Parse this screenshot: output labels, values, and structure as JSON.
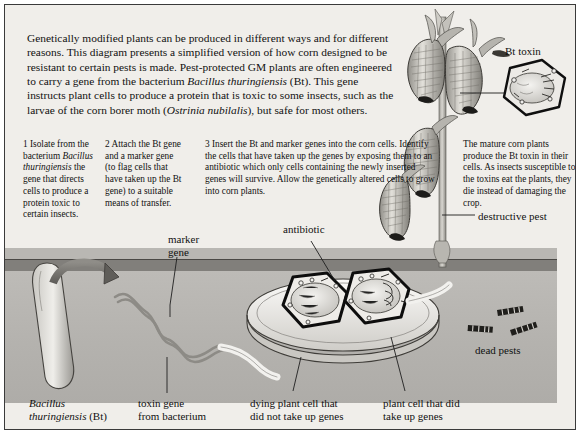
{
  "figure": {
    "intro": "Genetically modified plants can be produced in different ways and for different reasons. This diagram presents a simplified version of how corn designed to be resistant to certain pests is made. Pest-protected GM plants are often engineered to carry a gene from the bacterium ",
    "intro_italic_1": "Bacillus thuringiensis",
    "intro_mid": " (Bt). This gene instructs plant cells to produce a protein that is toxic to some insects, such as the larvae of the corn borer moth (",
    "intro_italic_2": "Ostrinia nubilalis",
    "intro_end": "), but safe for most others."
  },
  "steps": [
    {
      "number": "1",
      "text_a": "1 Isolate from the bacterium ",
      "italic": "Bacillus thuringiensis",
      "text_b": " the gene that directs cells to produce a protein toxic to certain insects."
    },
    {
      "number": "2",
      "text": "2 Attach the Bt gene and a marker gene (to flag cells that have taken up the Bt gene) to a suitable means of transfer."
    },
    {
      "number": "3",
      "text": "3 Insert the Bt and marker genes into the corn cells. Identify the cells that have taken up the genes by exposing them to an antibiotic which only cells containing the newly inserted genes will survive. Allow the genetically altered cells to grow into corn plants."
    }
  ],
  "mature_note": "The mature corn plants produce the Bt toxin in their cells. As insects susceptible to the toxins eat the plants, they die instead of damaging the crop.",
  "labels": {
    "bt_toxin": "Bt toxin",
    "destructive_pest": "destructive pest",
    "dead_pests": "dead pests",
    "marker_gene": "marker\ngene",
    "marker_gene_line1": "marker",
    "marker_gene_line2": "gene",
    "antibiotic": "antibiotic",
    "bacillus_line1": "Bacillus",
    "bacillus_line2": "thuringiensis",
    "bacillus_suffix": " (Bt)",
    "toxin_gene_line1": "toxin gene",
    "toxin_gene_line2": "from bacterium",
    "dying_cell_line1": "dying plant cell that",
    "dying_cell_line2": "did not take up genes",
    "took_cell_line1": "plant cell that did",
    "took_cell_line2": "take up genes"
  },
  "colors": {
    "frame_border": "#3a3a3a",
    "page_bg": "#f0eeea",
    "panel_gray": "#b9b7b3",
    "soil_dark": "#6f6c68",
    "ink": "#111111",
    "cell_outline": "#111111",
    "plant_green": "#8e8c86"
  }
}
